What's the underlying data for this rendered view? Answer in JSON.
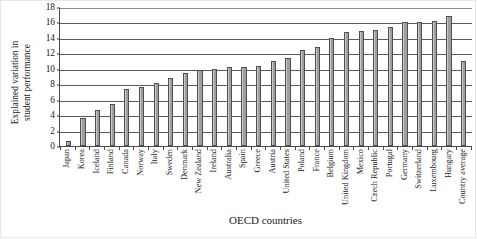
{
  "chart_data": {
    "type": "bar",
    "title": "",
    "xlabel": "OECD countries",
    "ylabel": "Explained variation in student performance",
    "ylabel_line1": "Explained variation in",
    "ylabel_line2": "student performance",
    "ylim": [
      0,
      18
    ],
    "ytick_step": 2,
    "yticks": [
      0,
      2,
      4,
      6,
      8,
      10,
      12,
      14,
      16,
      18
    ],
    "grid": true,
    "grid_axis": "y",
    "legend": false,
    "orientation": "vertical",
    "bar_fill_color": "#a8a8a8",
    "bar_edge_color": "#4f4f4f",
    "categories": [
      "Japan",
      "Korea",
      "Iceland",
      "Finland",
      "Canada",
      "Norway",
      "Italy",
      "Sweden",
      "Denmark",
      "New Zealand",
      "Ireland",
      "Australia",
      "Spain",
      "Greece",
      "Austria",
      "United States",
      "Poland",
      "France",
      "Belgium",
      "United Kingdom",
      "Mexico",
      "Czech Republic",
      "Portugal",
      "Germany",
      "Switzerland",
      "Luxembourg",
      "Hungary",
      "Country average"
    ],
    "values": [
      0.7,
      3.6,
      4.7,
      5.5,
      7.4,
      7.6,
      8.1,
      8.8,
      9.4,
      9.9,
      10.0,
      10.2,
      10.2,
      10.4,
      11.0,
      11.4,
      12.4,
      12.8,
      14.0,
      14.7,
      14.9,
      15.0,
      15.4,
      16.0,
      16.0,
      16.2,
      16.8,
      11.0
    ]
  }
}
